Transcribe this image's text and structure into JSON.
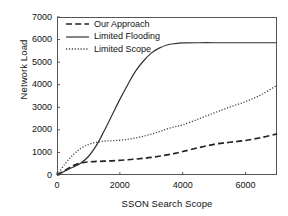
{
  "chart_data": {
    "type": "line",
    "title": "",
    "xlabel": "SSON Search Scope",
    "ylabel": "Network Load",
    "xlim": [
      0,
      7000
    ],
    "ylim": [
      0,
      7000
    ],
    "xticks": [
      0,
      2000,
      4000,
      6000
    ],
    "yticks": [
      0,
      1000,
      2000,
      3000,
      4000,
      5000,
      6000,
      7000
    ],
    "grid": false,
    "legend_position": "top-left",
    "x": [
      0,
      250,
      500,
      750,
      1000,
      1250,
      1500,
      1750,
      2000,
      2250,
      2500,
      2750,
      3000,
      3250,
      3500,
      3750,
      4000,
      4500,
      5000,
      5500,
      6000,
      6500,
      7000
    ],
    "series": [
      {
        "name": "Our Approach",
        "style": "dashed",
        "color": "#222222",
        "values": [
          0,
          200,
          400,
          530,
          580,
          600,
          615,
          630,
          650,
          675,
          705,
          740,
          780,
          830,
          890,
          960,
          1040,
          1210,
          1360,
          1450,
          1530,
          1660,
          1820
        ]
      },
      {
        "name": "Limited Flooding",
        "style": "solid",
        "color": "#333333",
        "values": [
          0,
          170,
          340,
          520,
          820,
          1300,
          1950,
          2650,
          3350,
          4000,
          4600,
          5050,
          5400,
          5620,
          5760,
          5820,
          5850,
          5860,
          5860,
          5860,
          5860,
          5860,
          5860
        ]
      },
      {
        "name": "Limited Scope",
        "style": "dotted",
        "color": "#444444",
        "values": [
          0,
          480,
          880,
          1170,
          1350,
          1450,
          1500,
          1520,
          1540,
          1580,
          1640,
          1720,
          1810,
          1920,
          2040,
          2140,
          2220,
          2480,
          2750,
          3010,
          3250,
          3560,
          3980
        ]
      }
    ]
  },
  "legend": {
    "items": [
      {
        "label": "Our Approach",
        "key": "dashed-line-key"
      },
      {
        "label": "Limited Flooding",
        "key": "solid-line-key"
      },
      {
        "label": "Limited Scope",
        "key": "dotted-line-key"
      }
    ]
  },
  "axes": {
    "y_title": "Network Load",
    "x_title": "SSON Search Scope",
    "y_tick_labels": [
      "7000",
      "6000",
      "5000",
      "4000",
      "3000",
      "2000",
      "1000",
      "0"
    ],
    "x_tick_labels": [
      "0",
      "2000",
      "4000",
      "6000"
    ]
  }
}
